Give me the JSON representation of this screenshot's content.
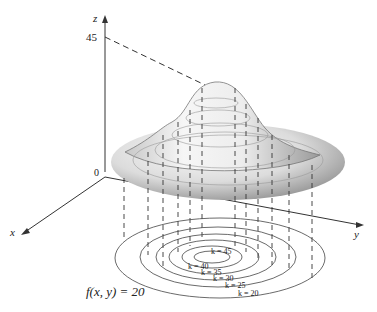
{
  "axes": {
    "z_label": "z",
    "x_label": "x",
    "y_label": "y",
    "origin_label": "0",
    "z_tick_label": "45"
  },
  "level_curves": {
    "labels": [
      "k = 45",
      "k = 40",
      "k = 35",
      "k = 30",
      "k = 25",
      "k = 20"
    ]
  },
  "annotation": {
    "equation": "f(x, y) = 20"
  },
  "colors": {
    "line": "#333333",
    "surface_light": "#f4f4f4",
    "surface_dark": "#8a8a8a"
  }
}
